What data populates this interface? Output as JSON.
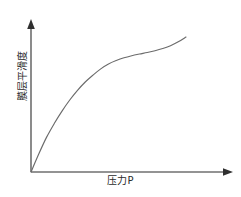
{
  "chart_data": {
    "type": "line",
    "title": "",
    "subtitle": "",
    "xlabel": "压力P",
    "ylabel": "膜层平滑度",
    "grid": false,
    "legend": null,
    "xlim": [
      0,
      1
    ],
    "ylim": [
      0,
      1
    ],
    "xticks": [],
    "yticks": [],
    "annotations": [],
    "axis_style": {
      "x_arrow": true,
      "y_arrow": true,
      "origin_label": ""
    },
    "series": [
      {
        "name": "膜层平滑度-压力P曲线",
        "color": "#6b6b6b",
        "x": [
          0.0,
          0.05,
          0.1,
          0.15,
          0.2,
          0.25,
          0.3,
          0.35,
          0.4,
          0.45,
          0.5,
          0.55,
          0.6,
          0.65,
          0.7,
          0.75,
          0.8,
          0.85,
          0.9,
          0.95,
          1.0
        ],
        "y": [
          0.0,
          0.13,
          0.25,
          0.35,
          0.44,
          0.52,
          0.59,
          0.65,
          0.7,
          0.745,
          0.78,
          0.805,
          0.825,
          0.84,
          0.852,
          0.863,
          0.876,
          0.892,
          0.912,
          0.94,
          0.975
        ]
      }
    ]
  },
  "axes": {
    "x": {
      "label": "压力P"
    },
    "y": {
      "label": "膜层平滑度"
    }
  },
  "colors": {
    "background": "#ffffff",
    "axis": "#6f6f6f",
    "curve": "#6b6b6b",
    "text": "#2b2b2b"
  }
}
